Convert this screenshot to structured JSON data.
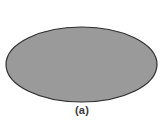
{
  "figure": {
    "caption": "(a)",
    "background_color": "#ffffff",
    "shapes": [
      {
        "name": "ellipse",
        "type": "ellipse",
        "center_x": 81.5,
        "center_y": 64.5,
        "radius_x": 75.5,
        "radius_y": 37.5,
        "fill_color": "#9a9a9a",
        "stroke_color": "#2e2e2e",
        "stroke_width": 1.2
      }
    ]
  }
}
